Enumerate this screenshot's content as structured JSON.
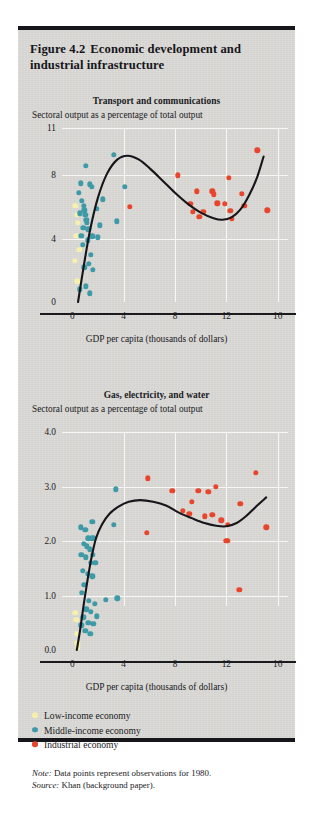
{
  "figure": {
    "number": "Figure 4.2",
    "title": "Economic development and industrial infrastructure"
  },
  "colors": {
    "low_income": "#f5f0ab",
    "middle_income": "#3d9aa6",
    "industrial": "#e8452c",
    "curve": "#16151a",
    "grid": "#f7f7f5",
    "panel_bg": "#d9d8d4",
    "axis": "#1b1a1e"
  },
  "legend": {
    "items": [
      {
        "label": "Low-income economy",
        "color_key": "low_income"
      },
      {
        "label": "Middle-income economy",
        "color_key": "middle_income"
      },
      {
        "label": "Industrial economy",
        "color_key": "industrial"
      }
    ]
  },
  "notes": {
    "note_label": "Note:",
    "note_text": " Data points represent observations for 1980.",
    "source_label": "Source:",
    "source_text": " Khan (background paper)."
  },
  "chart_data": [
    {
      "type": "scatter",
      "title": "Transport and communications",
      "subtitle": "Sectoral output as a percentage of total output",
      "xlabel": "GDP per capita (thousands of dollars)",
      "ylabel": "Sectoral output as a percentage of total output",
      "xlim": [
        -0.8,
        16.8
      ],
      "ylim": [
        0,
        11
      ],
      "xticks": [
        0,
        4,
        8,
        12,
        16
      ],
      "xtick_labels": [
        "0",
        "4",
        "8",
        "12",
        "16"
      ],
      "yticks": [
        0,
        4,
        8,
        11
      ],
      "ytick_labels": [
        "0",
        "4",
        "8",
        "11"
      ],
      "grid": true,
      "legend_position": "below-figure",
      "series": [
        {
          "name": "Low-income economy",
          "color_key": "low_income",
          "points": [
            [
              0.25,
              6.1
            ],
            [
              0.35,
              5.5
            ],
            [
              0.45,
              5.0
            ],
            [
              0.3,
              4.2
            ],
            [
              0.55,
              3.3
            ],
            [
              0.2,
              2.6
            ],
            [
              0.4,
              1.3
            ]
          ]
        },
        {
          "name": "Middle-income economy",
          "color_key": "middle_income",
          "points": [
            [
              3.25,
              9.3
            ],
            [
              1.05,
              8.6
            ],
            [
              0.65,
              7.5
            ],
            [
              1.35,
              7.45
            ],
            [
              1.5,
              7.3
            ],
            [
              0.5,
              6.9
            ],
            [
              4.1,
              7.3
            ],
            [
              0.75,
              6.4
            ],
            [
              2.4,
              6.5
            ],
            [
              0.9,
              6.1
            ],
            [
              0.95,
              5.8
            ],
            [
              1.0,
              5.5
            ],
            [
              1.1,
              5.2
            ],
            [
              1.15,
              5.0
            ],
            [
              0.6,
              5.6
            ],
            [
              1.9,
              5.9
            ],
            [
              3.45,
              5.1
            ],
            [
              0.85,
              4.7
            ],
            [
              1.25,
              4.6
            ],
            [
              2.15,
              4.85
            ],
            [
              0.7,
              4.2
            ],
            [
              1.55,
              4.15
            ],
            [
              2.0,
              4.1
            ],
            [
              1.2,
              3.9
            ],
            [
              0.8,
              3.6
            ],
            [
              1.45,
              3.0
            ],
            [
              1.3,
              2.4
            ],
            [
              0.95,
              2.2
            ],
            [
              1.6,
              2.05
            ],
            [
              1.05,
              1.0
            ],
            [
              0.6,
              0.8
            ],
            [
              1.35,
              0.55
            ]
          ]
        },
        {
          "name": "Industrial economy",
          "color_key": "industrial",
          "points": [
            [
              14.4,
              9.6
            ],
            [
              8.2,
              8.0
            ],
            [
              12.2,
              7.85
            ],
            [
              4.5,
              6.0
            ],
            [
              9.7,
              7.0
            ],
            [
              10.9,
              7.0
            ],
            [
              11.0,
              6.8
            ],
            [
              13.2,
              6.85
            ],
            [
              9.2,
              6.2
            ],
            [
              11.3,
              6.25
            ],
            [
              11.9,
              6.2
            ],
            [
              13.4,
              6.1
            ],
            [
              9.4,
              5.7
            ],
            [
              10.2,
              5.7
            ],
            [
              12.3,
              5.75
            ],
            [
              15.2,
              5.8
            ],
            [
              12.4,
              5.25
            ],
            [
              9.9,
              5.4
            ]
          ]
        }
      ],
      "fitted_curve": {
        "description": "cubic-like fitted trend line",
        "points": [
          [
            0.45,
            0.0
          ],
          [
            0.9,
            2.3
          ],
          [
            1.4,
            4.6
          ],
          [
            2.0,
            6.6
          ],
          [
            2.7,
            8.1
          ],
          [
            3.5,
            9.0
          ],
          [
            4.3,
            9.25
          ],
          [
            5.2,
            9.0
          ],
          [
            6.1,
            8.4
          ],
          [
            7.0,
            7.7
          ],
          [
            8.0,
            6.9
          ],
          [
            9.0,
            6.2
          ],
          [
            10.0,
            5.65
          ],
          [
            11.0,
            5.3
          ],
          [
            11.7,
            5.2
          ],
          [
            12.4,
            5.35
          ],
          [
            13.1,
            5.85
          ],
          [
            13.8,
            6.8
          ],
          [
            14.4,
            7.9
          ],
          [
            14.9,
            9.2
          ]
        ]
      }
    },
    {
      "type": "scatter",
      "title": "Gas, electricity, and water",
      "subtitle": "Sectoral output as a percentage of total output",
      "xlabel": "GDP per capita (thousands of dollars)",
      "ylabel": "Sectoral output as a percentage of total output",
      "xlim": [
        -0.8,
        16.8
      ],
      "ylim": [
        0.0,
        4.0
      ],
      "xticks": [
        0,
        4,
        8,
        12,
        16
      ],
      "xtick_labels": [
        "0",
        "4",
        "8",
        "12",
        "16"
      ],
      "yticks": [
        0.0,
        1.0,
        2.0,
        3.0,
        4.0
      ],
      "ytick_labels": [
        "0.0",
        "1.0",
        "2.0",
        "3.0",
        "4.0"
      ],
      "grid": true,
      "legend_position": "below-figure",
      "series": [
        {
          "name": "Low-income economy",
          "color_key": "low_income",
          "points": [
            [
              0.3,
              0.55
            ],
            [
              0.35,
              0.3
            ],
            [
              0.4,
              0.12
            ],
            [
              0.45,
              0.05
            ],
            [
              0.25,
              0.68
            ]
          ]
        },
        {
          "name": "Middle-income economy",
          "color_key": "middle_income",
          "points": [
            [
              3.4,
              2.95
            ],
            [
              1.55,
              2.35
            ],
            [
              0.65,
              2.25
            ],
            [
              1.0,
              2.2
            ],
            [
              1.25,
              2.05
            ],
            [
              1.5,
              2.05
            ],
            [
              1.7,
              2.05
            ],
            [
              0.9,
              1.95
            ],
            [
              1.15,
              1.9
            ],
            [
              1.35,
              1.85
            ],
            [
              0.7,
              1.75
            ],
            [
              1.6,
              1.75
            ],
            [
              1.05,
              1.7
            ],
            [
              1.45,
              1.6
            ],
            [
              1.8,
              1.6
            ],
            [
              3.25,
              2.3
            ],
            [
              0.8,
              1.45
            ],
            [
              1.2,
              1.4
            ],
            [
              1.55,
              1.35
            ],
            [
              0.95,
              1.2
            ],
            [
              2.6,
              0.92
            ],
            [
              3.5,
              0.95
            ],
            [
              0.75,
              1.05
            ],
            [
              1.3,
              0.9
            ],
            [
              1.75,
              0.85
            ],
            [
              1.1,
              0.75
            ],
            [
              1.45,
              0.7
            ],
            [
              1.9,
              0.62
            ],
            [
              0.85,
              0.6
            ],
            [
              1.25,
              0.5
            ],
            [
              1.65,
              0.48
            ],
            [
              0.7,
              0.45
            ],
            [
              1.0,
              0.35
            ],
            [
              1.4,
              0.3
            ]
          ]
        },
        {
          "name": "Industrial economy",
          "color_key": "industrial",
          "points": [
            [
              14.3,
              3.25
            ],
            [
              5.9,
              3.15
            ],
            [
              11.2,
              3.0
            ],
            [
              7.8,
              2.92
            ],
            [
              9.8,
              2.92
            ],
            [
              10.6,
              2.9
            ],
            [
              9.3,
              2.72
            ],
            [
              13.1,
              2.68
            ],
            [
              8.6,
              2.55
            ],
            [
              9.1,
              2.5
            ],
            [
              10.3,
              2.45
            ],
            [
              10.9,
              2.48
            ],
            [
              11.6,
              2.38
            ],
            [
              12.1,
              2.3
            ],
            [
              15.1,
              2.25
            ],
            [
              5.8,
              2.15
            ],
            [
              12.0,
              2.0
            ],
            [
              12.1,
              2.0
            ],
            [
              13.0,
              1.1
            ]
          ]
        }
      ],
      "fitted_curve": {
        "description": "S-shaped fitted trend line",
        "points": [
          [
            0.35,
            0.0
          ],
          [
            0.6,
            0.35
          ],
          [
            0.9,
            0.85
          ],
          [
            1.2,
            1.3
          ],
          [
            1.5,
            1.7
          ],
          [
            1.85,
            2.05
          ],
          [
            2.3,
            2.3
          ],
          [
            2.9,
            2.5
          ],
          [
            3.6,
            2.63
          ],
          [
            4.4,
            2.72
          ],
          [
            5.3,
            2.75
          ],
          [
            6.3,
            2.72
          ],
          [
            7.3,
            2.65
          ],
          [
            8.3,
            2.52
          ],
          [
            9.3,
            2.42
          ],
          [
            10.3,
            2.33
          ],
          [
            11.2,
            2.28
          ],
          [
            12.0,
            2.27
          ],
          [
            12.8,
            2.33
          ],
          [
            13.6,
            2.47
          ],
          [
            14.4,
            2.65
          ],
          [
            15.1,
            2.8
          ]
        ]
      }
    }
  ]
}
